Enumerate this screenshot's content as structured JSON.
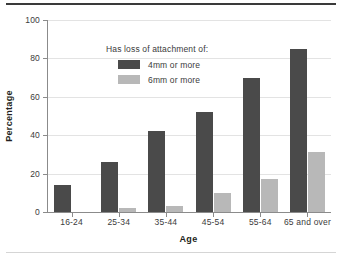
{
  "chart_data": {
    "type": "bar",
    "title": "",
    "xlabel": "Age",
    "ylabel": "Percentage",
    "categories": [
      "16-24",
      "25-34",
      "35-44",
      "45-54",
      "55-64",
      "65 and over"
    ],
    "series": [
      {
        "name": "4mm or more",
        "color": "#4a4a4a",
        "values": [
          14,
          26,
          42,
          52,
          70,
          85
        ]
      },
      {
        "name": "6mm or more",
        "color": "#b8b8b8",
        "values": [
          0,
          2,
          3,
          10,
          17,
          31
        ]
      }
    ],
    "ylim": [
      0,
      100
    ],
    "yticks": [
      0,
      20,
      40,
      60,
      80,
      100
    ],
    "grid": true,
    "legend": {
      "title": "Has loss of attachment of:",
      "position": "upper-left-inside",
      "entries": [
        "4mm or more",
        "6mm or more"
      ]
    }
  },
  "colors": {
    "series_dark": "#4a4a4a",
    "series_light": "#b8b8b8",
    "axis": "#8b8b8b",
    "gridline": "#e3e3e3",
    "rule_top": "#3a3a3a",
    "rule_bottom": "#d5d5d5",
    "text": "#3b3b3b"
  }
}
